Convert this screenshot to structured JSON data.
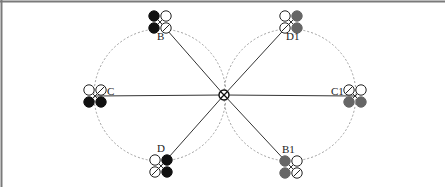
{
  "diagram": {
    "title": "",
    "colors": {
      "frame": "#7a7a7a",
      "line": "#333333",
      "dashed_circle": "#a0a0a0",
      "black_rotor": "#111111",
      "gray_rotor": "#666666",
      "open_rotor_stroke": "#222222"
    },
    "center": {
      "x": 224,
      "y": 95,
      "symbol": "crossed-circle-hub"
    },
    "circles": [
      {
        "name": "left-orbit",
        "cx": 160,
        "cy": 95,
        "r": 66
      },
      {
        "name": "right-orbit",
        "cx": 290,
        "cy": 95,
        "r": 66
      }
    ],
    "drones": [
      {
        "id": "B",
        "label": "B",
        "x": 160,
        "y": 22,
        "label_x": 157,
        "label_y": 40,
        "fill": "black",
        "filled_side": "left",
        "slashed": "bottom-right"
      },
      {
        "id": "C",
        "label": "C",
        "x": 95,
        "y": 96,
        "label_x": 107,
        "label_y": 95,
        "fill": "black",
        "filled_side": "bottom",
        "slashed": "top-right"
      },
      {
        "id": "D",
        "label": "D",
        "x": 161,
        "y": 166,
        "label_x": 157,
        "label_y": 152,
        "fill": "black",
        "filled_side": "right",
        "slashed": "bottom-left"
      },
      {
        "id": "D1",
        "label": "D1",
        "x": 291,
        "y": 22,
        "label_x": 286,
        "label_y": 40,
        "fill": "gray",
        "filled_side": "right",
        "slashed": "bottom-left"
      },
      {
        "id": "C1",
        "label": "C1",
        "x": 355,
        "y": 96,
        "label_x": 331,
        "label_y": 95,
        "fill": "gray",
        "filled_side": "bottom",
        "slashed": "top-left"
      },
      {
        "id": "B1",
        "label": "B1",
        "x": 291,
        "y": 167,
        "label_x": 282,
        "label_y": 153,
        "fill": "gray",
        "filled_side": "left",
        "slashed": "bottom-right"
      }
    ]
  }
}
